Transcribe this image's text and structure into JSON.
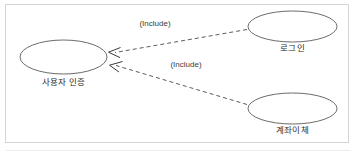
{
  "diagram": {
    "type": "uml-use-case-diagram",
    "background_color": "#ffffff",
    "frame_color": "#d5d5d5",
    "stroke_color": "#555555",
    "text_color": "#2b2b2b",
    "use_cases": [
      {
        "id": "user-auth",
        "label": "사용자 인증",
        "cx": 63.5,
        "cy": 57,
        "rx": 43.5,
        "ry": 17
      },
      {
        "id": "login",
        "label": "로그인",
        "cx": 292.5,
        "cy": 26.5,
        "rx": 44.5,
        "ry": 15.5
      },
      {
        "id": "account-transfer",
        "label": "계좌이체",
        "cx": 292.5,
        "cy": 108.5,
        "rx": 44.5,
        "ry": 15.5
      }
    ],
    "relationships": [
      {
        "id": "login-includes-user-auth",
        "label": "(Include)",
        "from": "login",
        "to": "user-auth",
        "style": "dashed",
        "arrow": "open",
        "label_x": 155,
        "label_y": 25
      },
      {
        "id": "transfer-includes-user-auth",
        "label": "(Include)",
        "from": "account-transfer",
        "to": "user-auth",
        "style": "dashed",
        "arrow": "open",
        "label_x": 186,
        "label_y": 66
      }
    ]
  }
}
